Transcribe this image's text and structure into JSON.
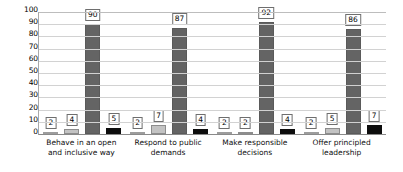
{
  "chart_data": {
    "type": "bar",
    "title": "",
    "subtitle": "",
    "xlabel": "",
    "ylabel": "",
    "ylim": [
      0,
      100
    ],
    "yticks": [
      100,
      90,
      80,
      70,
      60,
      50,
      40,
      30,
      20,
      10,
      0
    ],
    "grid": true,
    "legend": "none",
    "categories": [
      "Behave in an open and inclusive way",
      "Respond to public demands",
      "Make responsible decisions",
      "Offer principled leadership"
    ],
    "series": [
      {
        "name": "Series 1",
        "color": "#f2f2f2",
        "values": [
          2,
          2,
          2,
          2
        ]
      },
      {
        "name": "Series 2",
        "color": "#c3c3c3",
        "values": [
          4,
          7,
          2,
          5
        ]
      },
      {
        "name": "Series 3",
        "color": "#646464",
        "values": [
          90,
          87,
          92,
          86
        ]
      },
      {
        "name": "Series 4",
        "color": "#0d0d0d",
        "values": [
          5,
          4,
          4,
          7
        ]
      }
    ]
  },
  "axis": {
    "y_tick_labels": [
      "100",
      "90",
      "80",
      "70",
      "60",
      "50",
      "40",
      "30",
      "20",
      "10",
      "0"
    ]
  },
  "labels": {
    "groups": [
      {
        "category": "Behave in an open and inclusive way",
        "values": [
          "2",
          "4",
          "90",
          "5"
        ]
      },
      {
        "category": "Respond to public demands",
        "values": [
          "2",
          "7",
          "87",
          "4"
        ]
      },
      {
        "category": "Make responsible decisions",
        "values": [
          "2",
          "2",
          "92",
          "4"
        ]
      },
      {
        "category": "Offer principled leadership",
        "values": [
          "2",
          "5",
          "86",
          "7"
        ]
      }
    ]
  }
}
